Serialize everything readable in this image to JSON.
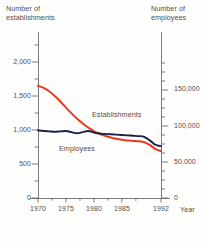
{
  "chart_data": {
    "type": "line",
    "title": "",
    "xlabel": "Year",
    "x": [
      1970,
      1971,
      1972,
      1973,
      1974,
      1975,
      1976,
      1977,
      1978,
      1979,
      1980,
      1981,
      1982,
      1983,
      1984,
      1985,
      1986,
      1987,
      1988,
      1989,
      1990,
      1991,
      1992
    ],
    "xlim": [
      1969,
      1993
    ],
    "x_ticks": [
      1970,
      1975,
      1980,
      1985,
      1992
    ],
    "x_tick_labels": [
      "1970",
      "1975",
      "1980",
      "1985",
      "1992"
    ],
    "grid": false,
    "legend": "inline-annotations",
    "axes": [
      {
        "id": "left",
        "label": "Number of\nestablishments",
        "label_line1": "Number of",
        "label_line2": "establishments",
        "ylim": [
          0,
          2500
        ],
        "ticks": [
          0,
          500,
          1000,
          1500,
          2000
        ],
        "tick_labels": [
          "0",
          "500",
          "1,000",
          "1,500",
          "2,000"
        ],
        "minor_tick_step": 250
      },
      {
        "id": "right",
        "label": "Number of\nemployees",
        "label_line1": "Number of",
        "label_line2": "employees",
        "ylim": [
          0,
          200000
        ],
        "ticks": [
          0,
          50000,
          100000,
          150000
        ],
        "tick_labels": [
          "0",
          "50,000",
          "100,000",
          "150,000"
        ],
        "minor_tick_step": 12500
      }
    ],
    "series": [
      {
        "name": "Establishments",
        "axis": "left",
        "color": "#e8391c",
        "annotation": "Establishments",
        "values": [
          1650,
          1620,
          1570,
          1500,
          1420,
          1330,
          1245,
          1165,
          1095,
          1035,
          985,
          945,
          915,
          890,
          870,
          855,
          845,
          840,
          835,
          820,
          780,
          720,
          690
        ]
      },
      {
        "name": "Employees",
        "axis": "right",
        "color": "#1b1f4b",
        "annotation": "Employees",
        "values": [
          94000,
          93000,
          92500,
          92000,
          92500,
          93000,
          91500,
          90000,
          91500,
          93000,
          91000,
          89500,
          89000,
          88500,
          88000,
          87500,
          87000,
          86500,
          86000,
          85000,
          80000,
          74000,
          72000
        ]
      }
    ]
  }
}
